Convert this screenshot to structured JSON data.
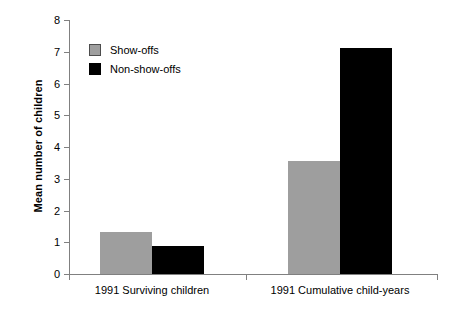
{
  "chart_data": {
    "type": "bar",
    "title": "",
    "xlabel": "",
    "ylabel": "Mean number of children",
    "ylim": [
      0,
      8
    ],
    "ytick_labels": [
      "0",
      "1",
      "2",
      "3",
      "4",
      "5",
      "6",
      "7",
      "8"
    ],
    "yticks": [
      0,
      1,
      2,
      3,
      4,
      5,
      6,
      7,
      8
    ],
    "grid": false,
    "legend_position": "upper-left-inside",
    "categories": [
      "1991 Surviving children",
      "1991 Cumulative child-years"
    ],
    "series": [
      {
        "name": "Show-offs",
        "color": "#9e9e9e",
        "values": [
          1.32,
          3.55
        ]
      },
      {
        "name": "Non-show-offs",
        "color": "#000000",
        "values": [
          0.89,
          7.11
        ]
      }
    ]
  },
  "legend": {
    "items": [
      {
        "label": "Show-offs",
        "swatch": "gray-square-swatch"
      },
      {
        "label": "Non-show-offs",
        "swatch": "black-square-swatch"
      }
    ]
  },
  "axes": {
    "y_title": "Mean number of children",
    "y_labels": [
      "8",
      "7",
      "6",
      "5",
      "4",
      "3",
      "2",
      "1",
      "0"
    ],
    "x_labels": [
      "1991 Surviving children",
      "1991 Cumulative child-years"
    ]
  },
  "colors": {
    "show_offs": "#9e9e9e",
    "non_show_offs": "#000000",
    "axis": "#808080",
    "background": "#ffffff"
  }
}
